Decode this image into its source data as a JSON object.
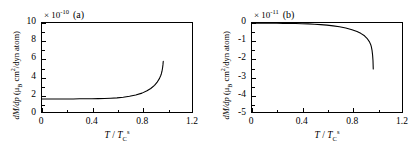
{
  "figure": {
    "panels": [
      {
        "letter": "(a)",
        "exponent_prefix": "× 10",
        "exponent_power": "-10",
        "y_axis_title_pre": "d",
        "y_axis_title_m": "M",
        "y_axis_title_mid": "/d",
        "y_axis_title_p": "p",
        "y_axis_title_units": " (μ",
        "y_axis_title_sub": "B",
        "y_axis_title_units2": " cm",
        "y_axis_title_sup": "2",
        "y_axis_title_units3": "/dyn atom)",
        "x_axis_title_t": "T",
        "x_axis_title_slash": " / ",
        "x_axis_title_tc": "T",
        "x_axis_title_tc_sub": "C",
        "x_axis_title_tc_sup": "s",
        "y_ticks": [
          "0",
          "2",
          "4",
          "6",
          "8",
          "10"
        ],
        "x_ticks": [
          "0",
          "0.4",
          "0.8",
          "1.2"
        ]
      },
      {
        "letter": "(b)",
        "exponent_prefix": "× 10",
        "exponent_power": "-11",
        "y_axis_title_pre": "d",
        "y_axis_title_m": "M",
        "y_axis_title_mid": "/d",
        "y_axis_title_p": "p",
        "y_axis_title_units": " (μ",
        "y_axis_title_sub": "B",
        "y_axis_title_units2": " cm",
        "y_axis_title_sup": "2",
        "y_axis_title_units3": "/dyn atom)",
        "x_axis_title_t": "T",
        "x_axis_title_slash": " / ",
        "x_axis_title_tc": "T",
        "x_axis_title_tc_sub": "C",
        "x_axis_title_tc_sup": "s",
        "y_ticks": [
          "-5",
          "-4",
          "-3",
          "-2",
          "-1",
          "0"
        ],
        "x_ticks": [
          "0",
          "0.4",
          "0.8",
          "1.2"
        ]
      }
    ]
  },
  "chart_data": [
    {
      "type": "line",
      "title": "(a)",
      "xlabel": "T / T_C^s",
      "ylabel": "dM/dp (μB cm^2/dyn atom)",
      "y_exponent": -10,
      "xlim": [
        0,
        1.2
      ],
      "ylim": [
        0,
        10
      ],
      "xticks": [
        0,
        0.4,
        0.8,
        1.2
      ],
      "yticks": [
        0,
        2,
        4,
        6,
        8,
        10
      ],
      "grid": false,
      "legend": "none",
      "series": [
        {
          "name": "dM/dp",
          "x": [
            0.0,
            0.05,
            0.1,
            0.15,
            0.2,
            0.25,
            0.3,
            0.35,
            0.4,
            0.45,
            0.5,
            0.55,
            0.6,
            0.65,
            0.7,
            0.75,
            0.8,
            0.84,
            0.87,
            0.9,
            0.92,
            0.94,
            0.95,
            0.955,
            0.96,
            0.965,
            0.968,
            0.97
          ],
          "y": [
            1.47,
            1.47,
            1.47,
            1.47,
            1.47,
            1.47,
            1.48,
            1.48,
            1.49,
            1.5,
            1.52,
            1.55,
            1.59,
            1.66,
            1.76,
            1.9,
            2.12,
            2.38,
            2.64,
            3.0,
            3.32,
            3.78,
            4.1,
            4.3,
            4.58,
            5.0,
            5.35,
            5.7
          ]
        }
      ]
    },
    {
      "type": "line",
      "title": "(b)",
      "xlabel": "T / T_C^s",
      "ylabel": "dM/dp (μB cm^2/dyn atom)",
      "y_exponent": -11,
      "xlim": [
        0,
        1.2
      ],
      "ylim": [
        -5,
        0
      ],
      "xticks": [
        0,
        0.4,
        0.8,
        1.2
      ],
      "yticks": [
        -5,
        -4,
        -3,
        -2,
        -1,
        0
      ],
      "grid": false,
      "legend": "none",
      "series": [
        {
          "name": "dM/dp",
          "x": [
            0.0,
            0.05,
            0.1,
            0.15,
            0.2,
            0.25,
            0.3,
            0.35,
            0.4,
            0.45,
            0.5,
            0.55,
            0.6,
            0.65,
            0.7,
            0.75,
            0.8,
            0.84,
            0.87,
            0.9,
            0.92,
            0.94,
            0.95,
            0.955,
            0.96,
            0.965,
            0.968,
            0.97
          ],
          "y": [
            -0.01,
            -0.01,
            -0.01,
            -0.01,
            -0.01,
            -0.02,
            -0.02,
            -0.03,
            -0.04,
            -0.05,
            -0.07,
            -0.09,
            -0.12,
            -0.16,
            -0.21,
            -0.28,
            -0.38,
            -0.48,
            -0.58,
            -0.72,
            -0.86,
            -1.06,
            -1.22,
            -1.34,
            -1.52,
            -1.82,
            -2.12,
            -2.58
          ]
        }
      ]
    }
  ]
}
